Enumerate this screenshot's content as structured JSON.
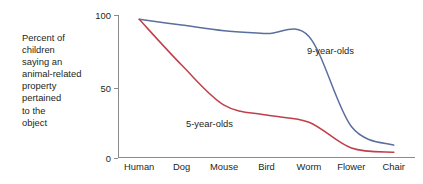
{
  "chart_data": {
    "type": "line",
    "title": "",
    "xlabel": "",
    "ylabel": "Percent of children saying an animal-related property pertained to the object",
    "ylim": [
      0,
      100
    ],
    "yticks": [
      0,
      50,
      100
    ],
    "ytick_labels": [
      "0",
      "50",
      "100"
    ],
    "grid": false,
    "legend_position": "inline-annotation",
    "categories": [
      "Human",
      "Dog",
      "Mouse",
      "Bird",
      "Worm",
      "Flower",
      "Chair"
    ],
    "series": [
      {
        "name": "9-year-olds",
        "color": "#5a6f9e",
        "values": [
          97,
          93,
          89,
          87,
          85,
          22,
          9
        ]
      },
      {
        "name": "5-year-olds",
        "color": "#c0404a",
        "values": [
          97,
          65,
          37,
          30,
          25,
          7,
          4
        ]
      }
    ],
    "annotations": [
      {
        "text": "9-year-olds",
        "series": "9-year-olds"
      },
      {
        "text": "5-year-olds",
        "series": "5-year-olds"
      }
    ]
  },
  "axis": {
    "y_caption_lines": [
      "Percent of",
      "children",
      "saying an",
      "animal-related",
      "property",
      "pertained",
      "to the",
      "object"
    ],
    "y_tick_100": "100",
    "y_tick_50": "50",
    "y_tick_0": "0"
  },
  "colors": {
    "nine_year_olds": "#5a6f9e",
    "five_year_olds": "#c0404a",
    "axis": "#8b8b8b",
    "text": "#231f20",
    "background": "#ffffff"
  }
}
